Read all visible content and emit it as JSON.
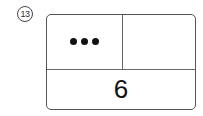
{
  "problem": {
    "number_label": "13",
    "top_left": {
      "dots": 3
    },
    "top_right": {
      "value": ""
    },
    "bottom": {
      "value": "6"
    }
  }
}
